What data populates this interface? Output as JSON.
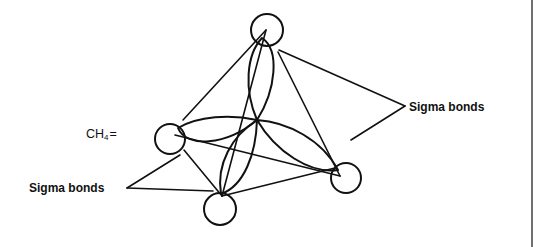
{
  "diagram": {
    "formula": {
      "prefix": "CH",
      "subscript": "4",
      "suffix": "="
    },
    "labels": {
      "sigma_right": "Sigma bonds",
      "sigma_left": "Sigma bonds"
    },
    "atoms": {
      "carbon": {
        "x": 257,
        "y": 120
      },
      "hydrogens": [
        {
          "name": "top",
          "cx": 267,
          "cy": 30,
          "r": 16,
          "vx": 266,
          "vy": 30
        },
        {
          "name": "left",
          "cx": 170,
          "cy": 139,
          "r": 15,
          "vx": 175,
          "vy": 135
        },
        {
          "name": "bottom",
          "cx": 220,
          "cy": 209,
          "r": 16,
          "vx": 222,
          "vy": 196
        },
        {
          "name": "right",
          "cx": 346,
          "cy": 178,
          "r": 15,
          "vx": 340,
          "vy": 176
        }
      ]
    },
    "colors": {
      "line": "#111111",
      "background": "#ffffff"
    }
  }
}
